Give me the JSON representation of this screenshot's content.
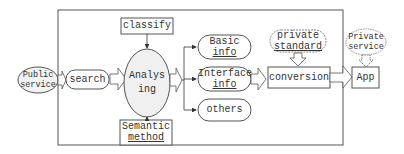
{
  "diagram": {
    "type": "flowchart",
    "nodes": {
      "public_service": "Public service",
      "public_service_l1": "Public",
      "public_service_l2": "service",
      "search": "search",
      "classify": "classify",
      "analysing_l1": "Analys",
      "analysing_l2": "ing",
      "semantic_l1": "Semantic",
      "semantic_l2": "method",
      "basic_l1": "Basic",
      "basic_l2": "info",
      "interface_l1": "Interface",
      "interface_l2": "info",
      "others": "others",
      "private_std_l1": "private",
      "private_std_l2": "standard",
      "conversion": "conversion",
      "private_svc_l1": "Private",
      "private_svc_l2": "service",
      "app": "App"
    },
    "edges": [
      {
        "from": "Public service",
        "to": "search",
        "style": "hollow-arrow"
      },
      {
        "from": "search",
        "to": "Analysing",
        "style": "hollow-arrow"
      },
      {
        "from": "classify",
        "to": "Analysing",
        "style": "line-arrow"
      },
      {
        "from": "Semantic method",
        "to": "Analysing",
        "style": "line-arrow"
      },
      {
        "from": "Analysing",
        "to": "Basic info",
        "style": "line-arrow"
      },
      {
        "from": "Analysing",
        "to": "Interface info",
        "style": "line-arrow"
      },
      {
        "from": "Analysing",
        "to": "others",
        "style": "line-arrow"
      },
      {
        "from": "Interface info",
        "to": "conversion",
        "style": "hollow-arrow"
      },
      {
        "from": "private standard",
        "to": "conversion",
        "style": "hollow-arrow"
      },
      {
        "from": "conversion",
        "to": "App",
        "style": "hollow-arrow"
      },
      {
        "from": "Private service",
        "to": "App",
        "style": "hollow-arrow"
      }
    ]
  }
}
